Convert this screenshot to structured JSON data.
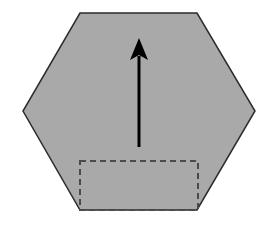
{
  "canvas": {
    "width": 274,
    "height": 226,
    "background": "#ffffff"
  },
  "hexagon": {
    "points": [
      [
        80,
        13
      ],
      [
        197,
        13
      ],
      [
        255,
        111
      ],
      [
        197,
        210
      ],
      [
        80,
        210
      ],
      [
        23,
        111
      ]
    ],
    "fill": "#a9a9a9",
    "stroke": "#2b2b2b",
    "stroke_width": 1.5
  },
  "arrow": {
    "x": 139,
    "tail_y": 147,
    "tip_y": 38,
    "head_length": 22,
    "head_half_width": 9,
    "color": "#000000",
    "stroke_width": 3
  },
  "dashed_rect": {
    "x": 80,
    "y": 161,
    "width": 118,
    "height": 49,
    "stroke": "#4a4a4a",
    "stroke_width": 2,
    "dash": "6,4"
  }
}
